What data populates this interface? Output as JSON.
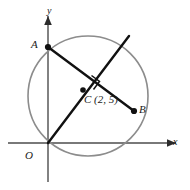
{
  "figure": {
    "background_color": "#ffffff"
  },
  "axes": {
    "x_label": "x",
    "y_label": "y",
    "color": "#4d4d4d",
    "origin_label": "O"
  },
  "circle": {
    "color": "#8c8c8c",
    "center_x_px": 88,
    "center_y_px": 96,
    "radius_px": 60
  },
  "points": {
    "A": {
      "label": "A",
      "x_px": 48,
      "y_px": 47
    },
    "B": {
      "label": "B",
      "x_px": 134,
      "y_px": 111
    },
    "C": {
      "label": "C (2, 5)",
      "x_px": 83,
      "y_px": 90
    },
    "O": {
      "label": "O",
      "x_px": 47,
      "y_px": 143
    }
  },
  "segments": {
    "chord_AB": {
      "name": "AB",
      "color": "#111111"
    },
    "line_OC": {
      "name": "OC extended",
      "color": "#111111"
    }
  },
  "markers": {
    "right_angle": {
      "name": "right-angle-mark",
      "color": "#111111"
    }
  }
}
